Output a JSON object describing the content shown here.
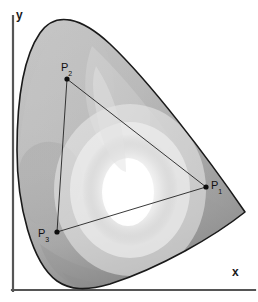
{
  "figure": {
    "background_color": "#ffffff",
    "outline_color": "#1a1a1a",
    "axes": {
      "x_label": "x",
      "y_label": "y",
      "axis_color": "#555555",
      "x_axis": {
        "x1": 13,
        "y1": 290,
        "x2": 255,
        "y2": 290
      },
      "y_axis": {
        "x1": 13,
        "y1": 290,
        "x2": 13,
        "y2": 16
      }
    },
    "points": [
      {
        "id": "P1",
        "label": "P",
        "subscript": "1",
        "name": "primary-red",
        "cx": 206,
        "cy": 187
      },
      {
        "id": "P2",
        "label": "P",
        "subscript": "2",
        "name": "primary-green",
        "cx": 67,
        "cy": 79
      },
      {
        "id": "P3",
        "label": "P",
        "subscript": "3",
        "name": "primary-blue",
        "cx": 57,
        "cy": 232
      }
    ],
    "triangle": {
      "name": "gamut-triangle",
      "stroke": "#222222",
      "stroke_width": 0.9,
      "vertices": [
        [
          206,
          187
        ],
        [
          67,
          79
        ],
        [
          57,
          232
        ]
      ]
    },
    "locus": {
      "name": "spectral-locus",
      "stroke": "#1a1a1a",
      "stroke_width": 1.6,
      "path": "M 17 150 C 17 96 24 56 40 33 C 56 10 82 18 110 44 C 150 82 206 155 245 212 C 215 236 160 268 110 284 C 86 291 70 290 57 281 C 32 263 17 206 17 150 Z"
    },
    "white_point": {
      "cx": 130,
      "cy": 190,
      "rx": 48,
      "ry": 56
    },
    "gray_levels": {
      "lightest": "#ffffff",
      "light": "#e8e8e8",
      "mid_light": "#d2d2d2",
      "mid": "#bdbdbd",
      "mid_dark": "#a8a8a8",
      "dark": "#949494",
      "darkest": "#7e7e7e"
    }
  }
}
